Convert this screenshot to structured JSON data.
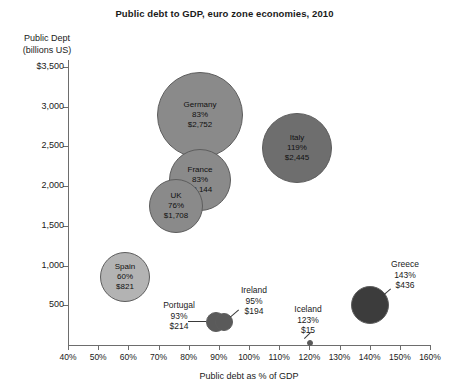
{
  "chart_data": {
    "type": "scatter",
    "title": "Public debt to GDP, euro zone economies, 2010",
    "xlabel": "Public debt as % of GDP",
    "ylabel": "Public Dept (billions US)",
    "ylabel_line1": "Public Dept",
    "ylabel_line2": "(billions US)",
    "xlim": [
      40,
      160
    ],
    "ylim": [
      0,
      3500
    ],
    "grid": false,
    "legend": "none",
    "xticks": [
      {
        "value": 40,
        "label": "40%"
      },
      {
        "value": 50,
        "label": "50%"
      },
      {
        "value": 60,
        "label": "60%"
      },
      {
        "value": 70,
        "label": "70%"
      },
      {
        "value": 80,
        "label": "80%"
      },
      {
        "value": 90,
        "label": "90%"
      },
      {
        "value": 100,
        "label": "100%"
      },
      {
        "value": 110,
        "label": "110%"
      },
      {
        "value": 120,
        "label": "120%"
      },
      {
        "value": 130,
        "label": "130%"
      },
      {
        "value": 140,
        "label": "140%"
      },
      {
        "value": 150,
        "label": "150%"
      },
      {
        "value": 160,
        "label": "160%"
      }
    ],
    "yticks": [
      {
        "value": 3500,
        "label": "$3,500"
      },
      {
        "value": 3000,
        "label": "3,000"
      },
      {
        "value": 2500,
        "label": "2,500"
      },
      {
        "value": 2000,
        "label": "2,000"
      },
      {
        "value": 1500,
        "label": "1,500"
      },
      {
        "value": 1000,
        "label": "1,000"
      },
      {
        "value": 500,
        "label": "500"
      }
    ],
    "points": [
      {
        "name": "Germany",
        "x": 83,
        "y": 2752,
        "pct_label": "83%",
        "debt_label": "$2,752",
        "label_placement": "inside",
        "color": "#8a8a8a",
        "px": 200,
        "py": 115,
        "r": 43
      },
      {
        "name": "France",
        "x": 83,
        "y": 2144,
        "pct_label": "83%",
        "debt_label": "$2,144",
        "label_placement": "inside",
        "color": "#8a8a8a",
        "px": 200,
        "py": 180,
        "r": 31
      },
      {
        "name": "UK",
        "x": 76,
        "y": 1708,
        "pct_label": "76%",
        "debt_label": "$1,708",
        "label_placement": "inside",
        "color": "#8a8a8a",
        "px": 176,
        "py": 206,
        "r": 27
      },
      {
        "name": "Italy",
        "x": 119,
        "y": 2445,
        "pct_label": "119%",
        "debt_label": "$2,445",
        "label_placement": "inside",
        "color": "#6e6e6e",
        "px": 297,
        "py": 148,
        "r": 35
      },
      {
        "name": "Spain",
        "x": 60,
        "y": 821,
        "pct_label": "60%",
        "debt_label": "$821",
        "label_placement": "inside",
        "color": "#b3b3b3",
        "px": 125,
        "py": 277,
        "r": 25
      },
      {
        "name": "Portugal",
        "x": 93,
        "y": 214,
        "pct_label": "93%",
        "debt_label": "$214",
        "label_placement": "left",
        "color": "#5a5a5a",
        "px": 216,
        "py": 322,
        "r": 10
      },
      {
        "name": "Ireland",
        "x": 95,
        "y": 194,
        "pct_label": "95%",
        "debt_label": "$194",
        "label_placement": "above-right",
        "color": "#5a5a5a",
        "px": 224,
        "py": 322,
        "r": 9
      },
      {
        "name": "Iceland",
        "x": 123,
        "y": 15,
        "pct_label": "123%",
        "debt_label": "$15",
        "label_placement": "above-left",
        "color": "#5a5a5a",
        "px": 310,
        "py": 343,
        "r": 3
      },
      {
        "name": "Greece",
        "x": 143,
        "y": 436,
        "pct_label": "143%",
        "debt_label": "$436",
        "label_placement": "above-right",
        "color": "#3c3c3c",
        "px": 370,
        "py": 305,
        "r": 19
      }
    ]
  }
}
